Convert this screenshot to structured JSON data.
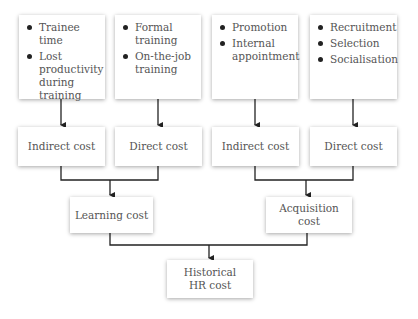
{
  "diagram": {
    "top_boxes": [
      {
        "items": [
          "Trainee time",
          "Lost productivity during training"
        ]
      },
      {
        "items": [
          "Formal training",
          "On-the-job training"
        ]
      },
      {
        "items": [
          "Promotion",
          "Internal appointment"
        ]
      },
      {
        "items": [
          "Recruitment",
          "Selection",
          "Socialisation"
        ]
      }
    ],
    "cost_boxes": [
      {
        "label": "Indirect cost"
      },
      {
        "label": "Direct cost"
      },
      {
        "label": "Indirect cost"
      },
      {
        "label": "Direct cost"
      }
    ],
    "learning_cost": "Learning cost",
    "acquisition_cost": "Acquisition cost",
    "historical_cost": "Historical HR cost"
  }
}
